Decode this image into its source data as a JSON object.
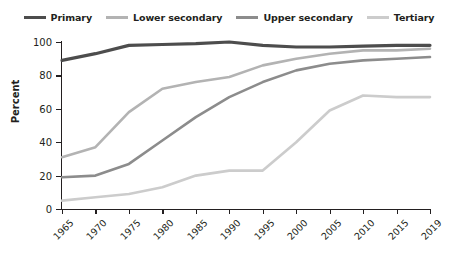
{
  "chart_data": {
    "type": "line",
    "title": "",
    "xlabel": "",
    "ylabel": "Percent",
    "ylim": [
      0,
      100
    ],
    "yticks": [
      0,
      20,
      40,
      60,
      80,
      100
    ],
    "grid": false,
    "legend_position": "top-center",
    "categories": [
      "1965",
      "1970",
      "1975",
      "1980",
      "1985",
      "1990",
      "1995",
      "2000",
      "2005",
      "2010",
      "2015",
      "2019"
    ],
    "x": [
      1965,
      1970,
      1975,
      1980,
      1985,
      1990,
      1995,
      2000,
      2005,
      2010,
      2015,
      2019
    ],
    "series": [
      {
        "name": "Primary",
        "color": "#4d4d4d",
        "values": [
          89,
          93,
          98,
          98.5,
          99,
          100,
          98,
          97,
          97,
          97.5,
          98,
          98
        ]
      },
      {
        "name": "Lower secondary",
        "color": "#b3b3b3",
        "values": [
          31,
          37,
          58,
          72,
          76,
          79,
          86,
          90,
          93,
          95,
          95,
          96
        ]
      },
      {
        "name": "Upper secondary",
        "color": "#8c8c8c",
        "values": [
          19,
          20,
          27,
          41,
          55,
          67,
          76,
          83,
          87,
          89,
          90,
          91
        ]
      },
      {
        "name": "Tertiary",
        "color": "#cccccc",
        "values": [
          5,
          7,
          9,
          13,
          20,
          23,
          23,
          40,
          59,
          68,
          67,
          67
        ]
      }
    ]
  },
  "legend": {
    "items": [
      {
        "label": "Primary",
        "color": "#4d4d4d"
      },
      {
        "label": "Lower secondary",
        "color": "#b3b3b3"
      },
      {
        "label": "Upper secondary",
        "color": "#8c8c8c"
      },
      {
        "label": "Tertiary",
        "color": "#cccccc"
      }
    ]
  },
  "axes": {
    "y_title": "Percent",
    "y_tick_labels": [
      "100",
      "80",
      "60",
      "40",
      "20",
      "0"
    ],
    "x_tick_labels": [
      "1965",
      "1970",
      "1975",
      "1980",
      "1985",
      "1990",
      "1995",
      "2000",
      "2005",
      "2010",
      "2015",
      "2019"
    ]
  }
}
